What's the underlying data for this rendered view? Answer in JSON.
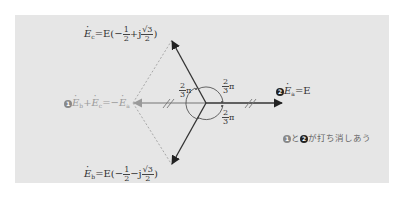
{
  "diagram": {
    "type": "phasor-diagram",
    "colors": {
      "background": "#e6e6e6",
      "vector": "#333333",
      "faint_vector": "#9a9a9a",
      "dotted_line": "#a0a0a0",
      "badge_1": "#888888",
      "badge_2": "#222222"
    },
    "vectors": {
      "Ea": {
        "label": "Ė_a = E",
        "badge": "2",
        "direction_deg": 0
      },
      "Eb": {
        "label": "Ė_b = E(−1/2 − j√3/2)",
        "direction_deg": -120
      },
      "Ec": {
        "label": "Ė_c = E(−1/2 + j√3/2)",
        "direction_deg": 120
      },
      "sum_bc": {
        "label": "Ė_b + Ė_c = −Ė_a",
        "badge": "1",
        "direction_deg": 180
      }
    },
    "labels": {
      "ec_prefix": "E",
      "ec_sub": "c",
      "ec_eq": "=E(−",
      "ec_half_num": "1",
      "ec_half_den": "2",
      "ec_plus_j": "+j",
      "ec_root_num": "√3",
      "ec_root_den": "2",
      "ec_close": ")",
      "eb_prefix": "E",
      "eb_sub": "b",
      "eb_eq": "=E(−",
      "eb_half_num": "1",
      "eb_half_den": "2",
      "eb_minus_j": "−j",
      "eb_root_num": "√3",
      "eb_root_den": "2",
      "eb_close": ")",
      "ea_badge": "2",
      "ea_prefix": "E",
      "ea_sub": "a",
      "ea_eq": "=E",
      "sum_badge": "1",
      "sum_e1": "E",
      "sum_sub1": "b",
      "sum_plus": "+",
      "sum_e2": "E",
      "sum_sub2": "c",
      "sum_eq": "=−",
      "sum_e3": "E",
      "sum_sub3": "a"
    },
    "angles": [
      {
        "num": "2",
        "den": "3",
        "pi": "π",
        "position": "upper-left"
      },
      {
        "num": "2",
        "den": "3",
        "pi": "π",
        "position": "upper-right"
      },
      {
        "num": "2",
        "den": "3",
        "pi": "π",
        "position": "lower-right"
      }
    ],
    "note": {
      "badge1": "1",
      "and": "と",
      "badge2": "2",
      "text": "が打ち消しあう"
    }
  }
}
